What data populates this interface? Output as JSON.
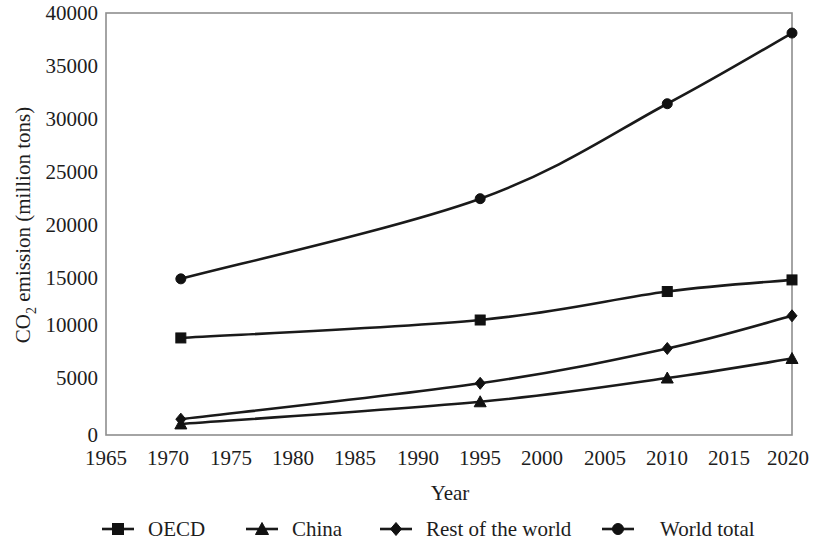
{
  "chart_data": {
    "type": "line",
    "title": "",
    "xlabel": "Year",
    "ylabel": "CO2 emission (million tons)",
    "ylabel_parts": {
      "pre": "CO",
      "sub": "2",
      "post": " emission (million tons)"
    },
    "x": [
      1971,
      1995,
      2010,
      2020
    ],
    "xlim": [
      1965,
      2020
    ],
    "ylim": [
      0,
      40000
    ],
    "xticks": [
      1965,
      1970,
      1975,
      1980,
      1985,
      1990,
      1995,
      2000,
      2005,
      2010,
      2015,
      2020
    ],
    "xtick_labels": [
      "1965",
      "1970",
      "1975",
      "1980",
      "1985",
      "1990",
      "1995",
      "2000",
      "2005",
      "2010",
      "2015",
      "2020"
    ],
    "yticks": [
      0,
      5000,
      10000,
      15000,
      20000,
      25000,
      30000,
      35000,
      40000
    ],
    "ytick_labels": [
      "0",
      "5000",
      "10000",
      "15000",
      "20000",
      "25000",
      "30000",
      "35000",
      "40000"
    ],
    "grid": false,
    "legend_position": "bottom",
    "series": [
      {
        "name": "OECD",
        "marker": "square",
        "values": [
          9200,
          10900,
          13600,
          14700
        ]
      },
      {
        "name": "China",
        "marker": "triangle",
        "values": [
          1050,
          3150,
          5400,
          7250
        ]
      },
      {
        "name": "Rest of the world",
        "marker": "diamond",
        "values": [
          1500,
          4900,
          8200,
          11300
        ]
      },
      {
        "name": "World total",
        "marker": "circle",
        "values": [
          14800,
          22400,
          31400,
          38100
        ]
      }
    ]
  },
  "legend": {
    "items": [
      {
        "label": "OECD",
        "marker": "square"
      },
      {
        "label": "China",
        "marker": "triangle"
      },
      {
        "label": "Rest of the world",
        "marker": "diamond"
      },
      {
        "label": "World total",
        "marker": "circle"
      }
    ]
  }
}
